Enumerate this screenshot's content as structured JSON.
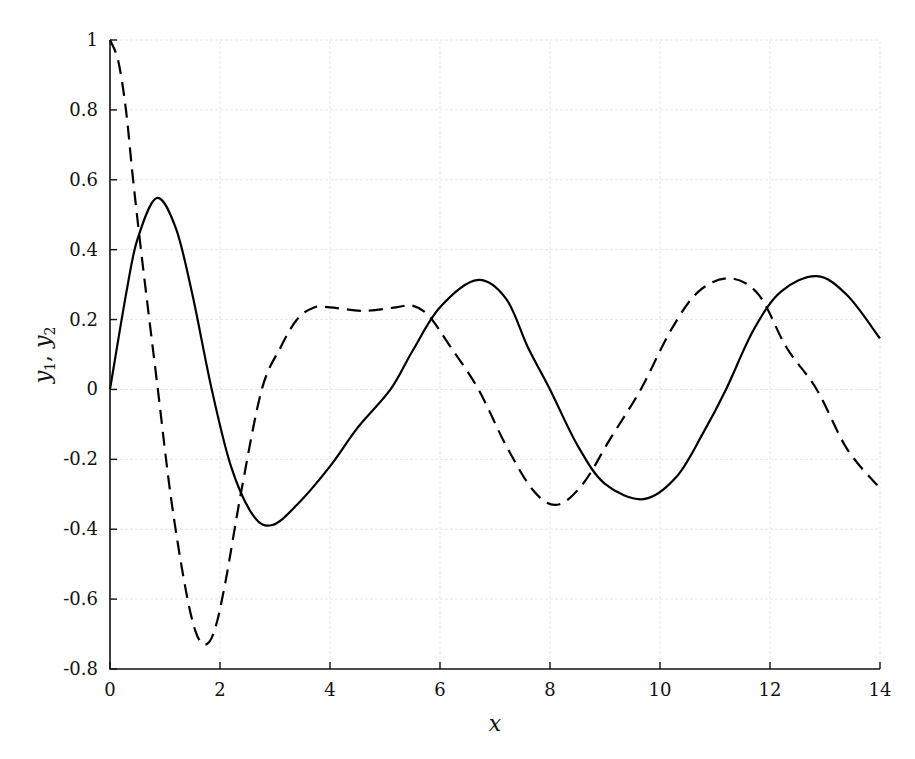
{
  "chart_data": {
    "type": "line",
    "title": "",
    "xlabel": "x",
    "ylabel": "y1, y2",
    "xlim": [
      0,
      14
    ],
    "ylim": [
      -0.8,
      1
    ],
    "grid": true,
    "legend": null,
    "x_ticks": [
      "0",
      "2",
      "4",
      "6",
      "8",
      "10",
      "12",
      "14"
    ],
    "y_ticks": [
      "1",
      "0.8",
      "0.6",
      "0.4",
      "0.2",
      "0",
      "-0.2",
      "-0.4",
      "-0.6",
      "-0.8"
    ],
    "series": [
      {
        "name": "y1",
        "style": "solid",
        "color": "#000000",
        "points": [
          [
            0,
            0
          ],
          [
            0.3,
            0.28
          ],
          [
            0.5,
            0.43
          ],
          [
            0.85,
            0.548
          ],
          [
            1.2,
            0.46
          ],
          [
            1.5,
            0.27
          ],
          [
            1.85,
            0
          ],
          [
            2.2,
            -0.22
          ],
          [
            2.6,
            -0.36
          ],
          [
            2.95,
            -0.388
          ],
          [
            3.4,
            -0.33
          ],
          [
            4,
            -0.22
          ],
          [
            4.5,
            -0.11
          ],
          [
            5.1,
            0
          ],
          [
            5.5,
            0.11
          ],
          [
            6,
            0.235
          ],
          [
            6.67,
            0.313
          ],
          [
            7.2,
            0.26
          ],
          [
            7.6,
            0.12
          ],
          [
            8,
            0
          ],
          [
            8.5,
            -0.16
          ],
          [
            9,
            -0.27
          ],
          [
            9.7,
            -0.314
          ],
          [
            10.3,
            -0.25
          ],
          [
            10.8,
            -0.12
          ],
          [
            11.2,
            0
          ],
          [
            11.7,
            0.17
          ],
          [
            12.2,
            0.28
          ],
          [
            12.85,
            0.324
          ],
          [
            13.4,
            0.27
          ],
          [
            14,
            0.146
          ]
        ]
      },
      {
        "name": "y2",
        "style": "dashed",
        "color": "#000000",
        "points": [
          [
            0,
            1
          ],
          [
            0.15,
            0.94
          ],
          [
            0.29,
            0.8
          ],
          [
            0.42,
            0.6
          ],
          [
            0.6,
            0.35
          ],
          [
            0.87,
            0
          ],
          [
            1.1,
            -0.3
          ],
          [
            1.35,
            -0.55
          ],
          [
            1.55,
            -0.69
          ],
          [
            1.73,
            -0.73
          ],
          [
            1.9,
            -0.69
          ],
          [
            2.1,
            -0.55
          ],
          [
            2.4,
            -0.28
          ],
          [
            2.76,
            0
          ],
          [
            3.1,
            0.12
          ],
          [
            3.4,
            0.2
          ],
          [
            3.7,
            0.234
          ],
          [
            4.0,
            0.235
          ],
          [
            4.6,
            0.225
          ],
          [
            5.2,
            0.235
          ],
          [
            5.5,
            0.24
          ],
          [
            5.8,
            0.21
          ],
          [
            6.2,
            0.12
          ],
          [
            6.7,
            0
          ],
          [
            7.2,
            -0.16
          ],
          [
            7.7,
            -0.29
          ],
          [
            8.13,
            -0.33
          ],
          [
            8.6,
            -0.27
          ],
          [
            9.1,
            -0.14
          ],
          [
            9.65,
            0
          ],
          [
            10.2,
            0.17
          ],
          [
            10.7,
            0.28
          ],
          [
            11.27,
            0.318
          ],
          [
            11.8,
            0.27
          ],
          [
            12.3,
            0.12
          ],
          [
            12.85,
            0
          ],
          [
            13.4,
            -0.17
          ],
          [
            14,
            -0.283
          ]
        ]
      }
    ]
  },
  "labels": {
    "xlabel": "x",
    "ylabel_main_1": "y",
    "ylabel_sub_1": "1",
    "ylabel_sep": ", ",
    "ylabel_main_2": "y",
    "ylabel_sub_2": "2"
  }
}
